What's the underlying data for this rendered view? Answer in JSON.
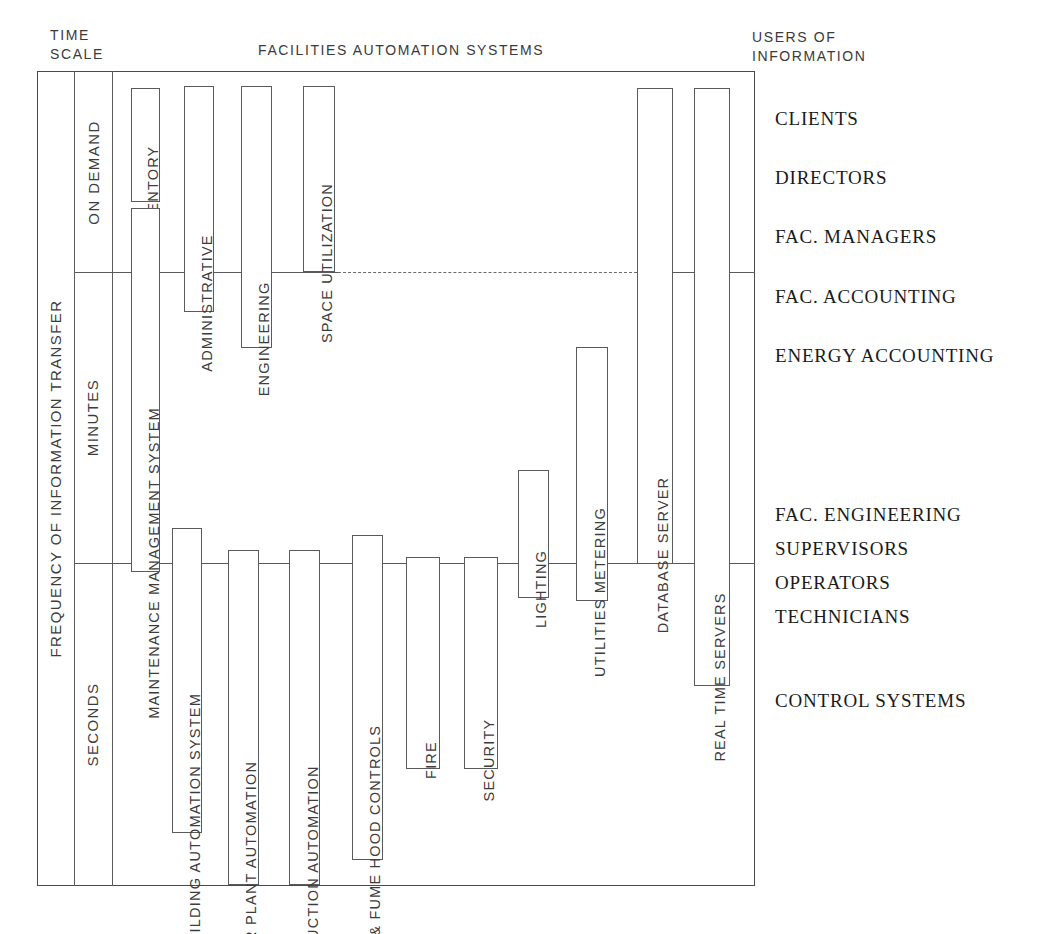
{
  "headings": {
    "time_scale_line1": "TIME",
    "time_scale_line2": "SCALE",
    "center_title": "FACILITIES AUTOMATION SYSTEMS",
    "users_line1": "USERS OF",
    "users_line2": "INFORMATION"
  },
  "y_axis": {
    "title": "FREQUENCY OF INFORMATION TRANSFER",
    "bands": [
      {
        "label": "ON DEMAND",
        "top": 72,
        "bottom": 272
      },
      {
        "label": "MINUTES",
        "top": 272,
        "bottom": 563
      },
      {
        "label": "SECONDS",
        "top": 563,
        "bottom": 885
      }
    ]
  },
  "systems": [
    {
      "label": "INVENTORY",
      "x": 131,
      "y": 88,
      "w": 29,
      "h": 114
    },
    {
      "label": "MAINTENANCE MANAGEMENT SYSTEM",
      "x": 131,
      "y": 208,
      "w": 29,
      "h": 364
    },
    {
      "label": "ADMINISTRATIVE",
      "x": 184,
      "y": 86,
      "w": 30,
      "h": 226
    },
    {
      "label": "ENGINEERING",
      "x": 241,
      "y": 86,
      "w": 31,
      "h": 262
    },
    {
      "label": "SPACE UTILIZATION",
      "x": 303,
      "y": 86,
      "w": 32,
      "h": 186
    },
    {
      "label": "BUILDING AUTOMATION SYSTEM",
      "x": 172,
      "y": 528,
      "w": 30,
      "h": 305
    },
    {
      "label": "POWER PLANT AUTOMATION",
      "x": 228,
      "y": 550,
      "w": 31,
      "h": 335
    },
    {
      "label": "PRODUCTION AUTOMATION",
      "x": 289,
      "y": 550,
      "w": 31,
      "h": 335
    },
    {
      "label": "LAB. & FUME HOOD CONTROLS",
      "x": 352,
      "y": 535,
      "w": 31,
      "h": 325
    },
    {
      "label": "FIRE",
      "x": 406,
      "y": 557,
      "w": 34,
      "h": 212
    },
    {
      "label": "SECURITY",
      "x": 464,
      "y": 557,
      "w": 34,
      "h": 212
    },
    {
      "label": "LIGHTING",
      "x": 518,
      "y": 470,
      "w": 31,
      "h": 128
    },
    {
      "label": "UTILITIES METERING",
      "x": 576,
      "y": 347,
      "w": 32,
      "h": 254
    },
    {
      "label": "DATABASE SERVER",
      "x": 637,
      "y": 88,
      "w": 36,
      "h": 476
    },
    {
      "label": "REAL TIME SERVERS",
      "x": 694,
      "y": 88,
      "w": 36,
      "h": 598
    }
  ],
  "users": [
    {
      "label": "CLIENTS",
      "y": 108
    },
    {
      "label": "DIRECTORS",
      "y": 167
    },
    {
      "label": "FAC. MANAGERS",
      "y": 226
    },
    {
      "label": "FAC. ACCOUNTING",
      "y": 286
    },
    {
      "label": "ENERGY ACCOUNTING",
      "y": 345
    },
    {
      "label": "FAC. ENGINEERING",
      "y": 504
    },
    {
      "label": "SUPERVISORS",
      "y": 538
    },
    {
      "label": "OPERATORS",
      "y": 572
    },
    {
      "label": "TECHNICIANS",
      "y": 606
    },
    {
      "label": "CONTROL SYSTEMS",
      "y": 690
    }
  ],
  "colors": {
    "ink": "#3c3c3c",
    "rule": "#5a5a5a",
    "serif_ink": "#1a1a1a",
    "paper": "#ffffff"
  }
}
